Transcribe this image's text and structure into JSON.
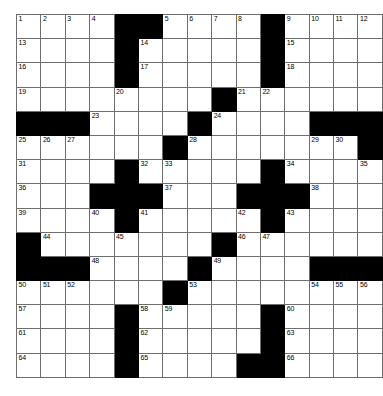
{
  "puzzle": {
    "type": "crossword-grid",
    "rows": 15,
    "columns": 15,
    "cell_size_px": 23.4,
    "colors": {
      "block": "#000000",
      "cell": "#ffffff",
      "grid_line": "#6e6e6e",
      "number_text": "#000000",
      "page_background": "#ffffff"
    },
    "grid": [
      [
        {
          "block": false,
          "num": "1"
        },
        {
          "block": false,
          "num": "2"
        },
        {
          "block": false,
          "num": "3"
        },
        {
          "block": false,
          "num": "4"
        },
        {
          "block": true,
          "num": ""
        },
        {
          "block": true,
          "num": ""
        },
        {
          "block": false,
          "num": "5"
        },
        {
          "block": false,
          "num": "6"
        },
        {
          "block": false,
          "num": "7"
        },
        {
          "block": false,
          "num": "8"
        },
        {
          "block": true,
          "num": ""
        },
        {
          "block": false,
          "num": "9"
        },
        {
          "block": false,
          "num": "10"
        },
        {
          "block": false,
          "num": "11"
        },
        {
          "block": false,
          "num": "12"
        }
      ],
      [
        {
          "block": false,
          "num": "13"
        },
        {
          "block": false,
          "num": ""
        },
        {
          "block": false,
          "num": ""
        },
        {
          "block": false,
          "num": ""
        },
        {
          "block": true,
          "num": ""
        },
        {
          "block": false,
          "num": "14"
        },
        {
          "block": false,
          "num": ""
        },
        {
          "block": false,
          "num": ""
        },
        {
          "block": false,
          "num": ""
        },
        {
          "block": false,
          "num": ""
        },
        {
          "block": true,
          "num": ""
        },
        {
          "block": false,
          "num": "15"
        },
        {
          "block": false,
          "num": ""
        },
        {
          "block": false,
          "num": ""
        },
        {
          "block": false,
          "num": ""
        }
      ],
      [
        {
          "block": false,
          "num": "16"
        },
        {
          "block": false,
          "num": ""
        },
        {
          "block": false,
          "num": ""
        },
        {
          "block": false,
          "num": ""
        },
        {
          "block": true,
          "num": ""
        },
        {
          "block": false,
          "num": "17"
        },
        {
          "block": false,
          "num": ""
        },
        {
          "block": false,
          "num": ""
        },
        {
          "block": false,
          "num": ""
        },
        {
          "block": false,
          "num": ""
        },
        {
          "block": true,
          "num": ""
        },
        {
          "block": false,
          "num": "18"
        },
        {
          "block": false,
          "num": ""
        },
        {
          "block": false,
          "num": ""
        },
        {
          "block": false,
          "num": ""
        }
      ],
      [
        {
          "block": false,
          "num": "19"
        },
        {
          "block": false,
          "num": ""
        },
        {
          "block": false,
          "num": ""
        },
        {
          "block": false,
          "num": ""
        },
        {
          "block": false,
          "num": "20"
        },
        {
          "block": false,
          "num": ""
        },
        {
          "block": false,
          "num": ""
        },
        {
          "block": false,
          "num": ""
        },
        {
          "block": true,
          "num": ""
        },
        {
          "block": false,
          "num": "21"
        },
        {
          "block": false,
          "num": "22"
        },
        {
          "block": false,
          "num": ""
        },
        {
          "block": false,
          "num": ""
        },
        {
          "block": false,
          "num": ""
        },
        {
          "block": false,
          "num": ""
        }
      ],
      [
        {
          "block": true,
          "num": ""
        },
        {
          "block": true,
          "num": ""
        },
        {
          "block": true,
          "num": ""
        },
        {
          "block": false,
          "num": "23"
        },
        {
          "block": false,
          "num": ""
        },
        {
          "block": false,
          "num": ""
        },
        {
          "block": false,
          "num": ""
        },
        {
          "block": true,
          "num": ""
        },
        {
          "block": false,
          "num": "24"
        },
        {
          "block": false,
          "num": ""
        },
        {
          "block": false,
          "num": ""
        },
        {
          "block": false,
          "num": ""
        },
        {
          "block": true,
          "num": ""
        },
        {
          "block": true,
          "num": ""
        },
        {
          "block": true,
          "num": ""
        }
      ],
      [
        {
          "block": false,
          "num": "25"
        },
        {
          "block": false,
          "num": "26"
        },
        {
          "block": false,
          "num": "27"
        },
        {
          "block": false,
          "num": ""
        },
        {
          "block": false,
          "num": ""
        },
        {
          "block": false,
          "num": ""
        },
        {
          "block": true,
          "num": ""
        },
        {
          "block": false,
          "num": "28"
        },
        {
          "block": false,
          "num": ""
        },
        {
          "block": false,
          "num": ""
        },
        {
          "block": false,
          "num": ""
        },
        {
          "block": false,
          "num": ""
        },
        {
          "block": false,
          "num": "29"
        },
        {
          "block": false,
          "num": "30"
        },
        {
          "block": true,
          "num": ""
        }
      ],
      [
        {
          "block": false,
          "num": "31"
        },
        {
          "block": false,
          "num": ""
        },
        {
          "block": false,
          "num": ""
        },
        {
          "block": false,
          "num": ""
        },
        {
          "block": true,
          "num": ""
        },
        {
          "block": false,
          "num": "32"
        },
        {
          "block": false,
          "num": "33"
        },
        {
          "block": false,
          "num": ""
        },
        {
          "block": false,
          "num": ""
        },
        {
          "block": false,
          "num": ""
        },
        {
          "block": true,
          "num": ""
        },
        {
          "block": false,
          "num": "34"
        },
        {
          "block": false,
          "num": ""
        },
        {
          "block": false,
          "num": ""
        },
        {
          "block": false,
          "num": "35"
        }
      ],
      [
        {
          "block": false,
          "num": "36"
        },
        {
          "block": false,
          "num": ""
        },
        {
          "block": false,
          "num": ""
        },
        {
          "block": true,
          "num": ""
        },
        {
          "block": true,
          "num": ""
        },
        {
          "block": true,
          "num": ""
        },
        {
          "block": false,
          "num": "37"
        },
        {
          "block": false,
          "num": ""
        },
        {
          "block": false,
          "num": ""
        },
        {
          "block": true,
          "num": ""
        },
        {
          "block": true,
          "num": ""
        },
        {
          "block": true,
          "num": ""
        },
        {
          "block": false,
          "num": "38"
        },
        {
          "block": false,
          "num": ""
        },
        {
          "block": false,
          "num": ""
        }
      ],
      [
        {
          "block": false,
          "num": "39"
        },
        {
          "block": false,
          "num": ""
        },
        {
          "block": false,
          "num": ""
        },
        {
          "block": false,
          "num": "40"
        },
        {
          "block": true,
          "num": ""
        },
        {
          "block": false,
          "num": "41"
        },
        {
          "block": false,
          "num": ""
        },
        {
          "block": false,
          "num": ""
        },
        {
          "block": false,
          "num": ""
        },
        {
          "block": false,
          "num": "42"
        },
        {
          "block": true,
          "num": ""
        },
        {
          "block": false,
          "num": "43"
        },
        {
          "block": false,
          "num": ""
        },
        {
          "block": false,
          "num": ""
        },
        {
          "block": false,
          "num": ""
        }
      ],
      [
        {
          "block": true,
          "num": ""
        },
        {
          "block": false,
          "num": "44"
        },
        {
          "block": false,
          "num": ""
        },
        {
          "block": false,
          "num": ""
        },
        {
          "block": false,
          "num": "45"
        },
        {
          "block": false,
          "num": ""
        },
        {
          "block": false,
          "num": ""
        },
        {
          "block": false,
          "num": ""
        },
        {
          "block": true,
          "num": ""
        },
        {
          "block": false,
          "num": "46"
        },
        {
          "block": false,
          "num": "47"
        },
        {
          "block": false,
          "num": ""
        },
        {
          "block": false,
          "num": ""
        },
        {
          "block": false,
          "num": ""
        },
        {
          "block": false,
          "num": ""
        }
      ],
      [
        {
          "block": true,
          "num": ""
        },
        {
          "block": true,
          "num": ""
        },
        {
          "block": true,
          "num": ""
        },
        {
          "block": false,
          "num": "48"
        },
        {
          "block": false,
          "num": ""
        },
        {
          "block": false,
          "num": ""
        },
        {
          "block": false,
          "num": ""
        },
        {
          "block": true,
          "num": ""
        },
        {
          "block": false,
          "num": "49"
        },
        {
          "block": false,
          "num": ""
        },
        {
          "block": false,
          "num": ""
        },
        {
          "block": false,
          "num": ""
        },
        {
          "block": true,
          "num": ""
        },
        {
          "block": true,
          "num": ""
        },
        {
          "block": true,
          "num": ""
        }
      ],
      [
        {
          "block": false,
          "num": "50"
        },
        {
          "block": false,
          "num": "51"
        },
        {
          "block": false,
          "num": "52"
        },
        {
          "block": false,
          "num": ""
        },
        {
          "block": false,
          "num": ""
        },
        {
          "block": false,
          "num": ""
        },
        {
          "block": true,
          "num": ""
        },
        {
          "block": false,
          "num": "53"
        },
        {
          "block": false,
          "num": ""
        },
        {
          "block": false,
          "num": ""
        },
        {
          "block": false,
          "num": ""
        },
        {
          "block": false,
          "num": ""
        },
        {
          "block": false,
          "num": "54"
        },
        {
          "block": false,
          "num": "55"
        },
        {
          "block": false,
          "num": "56"
        }
      ],
      [
        {
          "block": false,
          "num": "57"
        },
        {
          "block": false,
          "num": ""
        },
        {
          "block": false,
          "num": ""
        },
        {
          "block": false,
          "num": ""
        },
        {
          "block": true,
          "num": ""
        },
        {
          "block": false,
          "num": "58"
        },
        {
          "block": false,
          "num": "59"
        },
        {
          "block": false,
          "num": ""
        },
        {
          "block": false,
          "num": ""
        },
        {
          "block": false,
          "num": ""
        },
        {
          "block": true,
          "num": ""
        },
        {
          "block": false,
          "num": "60"
        },
        {
          "block": false,
          "num": ""
        },
        {
          "block": false,
          "num": ""
        },
        {
          "block": false,
          "num": ""
        }
      ],
      [
        {
          "block": false,
          "num": "61"
        },
        {
          "block": false,
          "num": ""
        },
        {
          "block": false,
          "num": ""
        },
        {
          "block": false,
          "num": ""
        },
        {
          "block": true,
          "num": ""
        },
        {
          "block": false,
          "num": "62"
        },
        {
          "block": false,
          "num": ""
        },
        {
          "block": false,
          "num": ""
        },
        {
          "block": false,
          "num": ""
        },
        {
          "block": false,
          "num": ""
        },
        {
          "block": true,
          "num": ""
        },
        {
          "block": false,
          "num": "63"
        },
        {
          "block": false,
          "num": ""
        },
        {
          "block": false,
          "num": ""
        },
        {
          "block": false,
          "num": ""
        }
      ],
      [
        {
          "block": false,
          "num": "64"
        },
        {
          "block": false,
          "num": ""
        },
        {
          "block": false,
          "num": ""
        },
        {
          "block": false,
          "num": ""
        },
        {
          "block": true,
          "num": ""
        },
        {
          "block": false,
          "num": "65"
        },
        {
          "block": false,
          "num": ""
        },
        {
          "block": false,
          "num": ""
        },
        {
          "block": false,
          "num": ""
        },
        {
          "block": true,
          "num": ""
        },
        {
          "block": true,
          "num": ""
        },
        {
          "block": false,
          "num": "66"
        },
        {
          "block": false,
          "num": ""
        },
        {
          "block": false,
          "num": ""
        },
        {
          "block": false,
          "num": ""
        }
      ]
    ]
  }
}
